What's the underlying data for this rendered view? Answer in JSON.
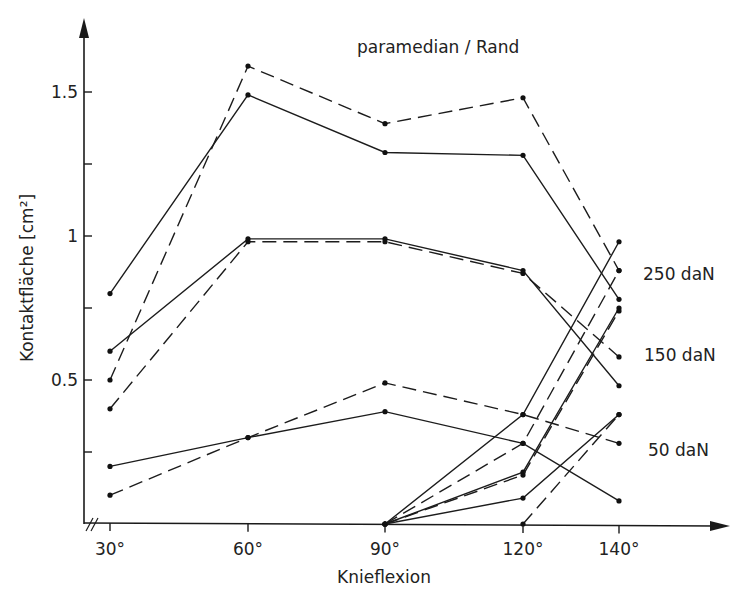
{
  "chart_data": {
    "type": "line",
    "title": "paramedian / Rand",
    "xlabel": "Knieflexion",
    "ylabel": "Kontaktfläche [cm²]",
    "x": [
      "30°",
      "60°",
      "90°",
      "120°",
      "140°"
    ],
    "x_ticks": [
      "30°",
      "60°",
      "90°",
      "120°",
      "140°"
    ],
    "y_ticks": [
      {
        "value": 0.5,
        "label": "0.5"
      },
      {
        "value": 0.75,
        "label": ""
      },
      {
        "value": 1.0,
        "label": "1"
      },
      {
        "value": 1.25,
        "label": ""
      },
      {
        "value": 1.5,
        "label": "1.5"
      },
      {
        "value": 0.25,
        "label": ""
      }
    ],
    "ylim": [
      0,
      1.75
    ],
    "grid": false,
    "axis_break": "x-axis broken near origin (//)",
    "annotations": [
      "250 daN",
      "150 daN",
      "50 daN"
    ],
    "series": [
      {
        "name": "250 daN paramedian (solid)",
        "style": "solid",
        "values": [
          0.8,
          1.49,
          1.29,
          1.28,
          0.78
        ]
      },
      {
        "name": "250 daN paramedian (dashed)",
        "style": "dashed",
        "values": [
          0.5,
          1.59,
          1.39,
          1.48,
          0.88
        ]
      },
      {
        "name": "150 daN paramedian (solid)",
        "style": "solid",
        "values": [
          0.6,
          0.99,
          0.99,
          0.88,
          0.48
        ]
      },
      {
        "name": "150 daN paramedian (dashed)",
        "style": "dashed",
        "values": [
          0.4,
          0.98,
          0.98,
          0.87,
          0.58
        ]
      },
      {
        "name": "50 daN paramedian (solid)",
        "style": "solid",
        "values": [
          0.2,
          0.3,
          0.39,
          0.28,
          0.08
        ]
      },
      {
        "name": "50 daN paramedian (dashed)",
        "style": "dashed",
        "values": [
          0.1,
          0.3,
          0.49,
          0.38,
          0.28
        ]
      },
      {
        "name": "250 daN Rand (solid)",
        "style": "solid",
        "values": [
          null,
          null,
          0.0,
          0.38,
          0.98
        ]
      },
      {
        "name": "250 daN Rand (dashed)",
        "style": "dashed",
        "values": [
          null,
          null,
          0.0,
          0.28,
          0.88
        ]
      },
      {
        "name": "150 daN Rand (solid)",
        "style": "solid",
        "values": [
          null,
          null,
          0.0,
          0.18,
          0.75
        ]
      },
      {
        "name": "150 daN Rand (dashed)",
        "style": "dashed",
        "values": [
          null,
          null,
          0.0,
          0.17,
          0.74
        ]
      },
      {
        "name": "50 daN Rand (solid)",
        "style": "solid",
        "values": [
          null,
          null,
          0.0,
          0.09,
          0.38
        ]
      },
      {
        "name": "50 daN Rand (dashed)",
        "style": "dashed",
        "values": [
          null,
          null,
          null,
          0.0,
          0.38
        ]
      }
    ]
  },
  "labels": {
    "title": "paramedian / Rand",
    "xlabel": "Knieflexion",
    "ylabel": "Kontaktfläche [cm²]",
    "load_250": "250 daN",
    "load_150": "150 daN",
    "load_50": "50 daN"
  }
}
